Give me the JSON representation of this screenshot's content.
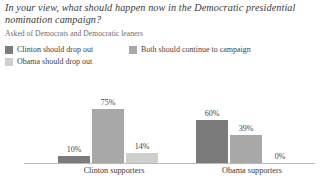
{
  "header": {
    "title": "In your view, what should happen now in the Democratic presidential nomination campaign?",
    "subtitle": "Asked of Democrats and Democratic leaners"
  },
  "legend": {
    "items": [
      {
        "label": "Clinton should drop out",
        "color": "#7b7b7b"
      },
      {
        "label": "Both should continue to campaign",
        "color": "#a8a8a8"
      },
      {
        "label": "Obama should drop out",
        "color": "#cfcfcf"
      }
    ]
  },
  "axis": {
    "categories": [
      "Clinton supporters",
      "Obama supporters"
    ]
  },
  "bars": {
    "clinton": [
      {
        "value": "10%",
        "height": 10
      },
      {
        "value": "75%",
        "height": 75
      },
      {
        "value": "14%",
        "height": 14
      }
    ],
    "obama": [
      {
        "value": "60%",
        "height": 60
      },
      {
        "value": "39%",
        "height": 39
      },
      {
        "value": "0%",
        "height": 0
      }
    ]
  },
  "chart_data": {
    "type": "bar",
    "title": "In your view, what should happen now in the Democratic presidential nomination campaign?",
    "subtitle": "Asked of Democrats and Democratic leaners",
    "xlabel": "",
    "ylabel": "",
    "ylim": [
      0,
      100
    ],
    "grid": false,
    "legend_position": "top-left",
    "categories": [
      "Clinton supporters",
      "Obama supporters"
    ],
    "series": [
      {
        "name": "Clinton should drop out",
        "color": "#7b7b7b",
        "values": [
          10,
          60
        ]
      },
      {
        "name": "Both should continue to campaign",
        "color": "#a8a8a8",
        "values": [
          75,
          39
        ]
      },
      {
        "name": "Obama should drop out",
        "color": "#cfcfcf",
        "values": [
          14,
          0
        ]
      }
    ],
    "data_labels": [
      [
        "10%",
        "75%",
        "14%"
      ],
      [
        "60%",
        "39%",
        "0%"
      ]
    ],
    "units": "percent"
  }
}
